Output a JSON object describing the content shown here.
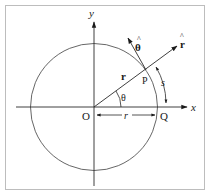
{
  "figure": {
    "colors": {
      "line": "#2a2a2a",
      "circle": "#555555",
      "border": "#bdbdbd",
      "background": "#ffffff"
    },
    "labels": {
      "x_axis": "x",
      "y_axis": "y",
      "origin": "O",
      "point_p": "P",
      "point_q": "Q",
      "position_vector": "r",
      "radius": "r",
      "angle": "θ",
      "arc_length": "s",
      "unit_r": "r",
      "unit_r_hat": "^",
      "unit_theta": "θ",
      "unit_theta_hat": "^"
    }
  }
}
